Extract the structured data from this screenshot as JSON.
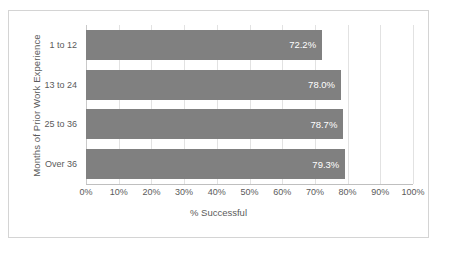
{
  "chart_data": {
    "type": "bar",
    "orientation": "horizontal",
    "title": "",
    "xlabel": "% Successful",
    "ylabel": "Months of Prior Work Experience",
    "categories": [
      "1 to 12",
      "13 to 24",
      "25 to 36",
      "Over 36"
    ],
    "values": [
      72.2,
      78.0,
      78.7,
      79.3
    ],
    "data_labels": [
      "72.2%",
      "78.0%",
      "78.7%",
      "79.3%"
    ],
    "xlim": [
      0,
      100
    ],
    "xticks": [
      0,
      10,
      20,
      30,
      40,
      50,
      60,
      70,
      80,
      90,
      100
    ],
    "xtick_labels": [
      "0%",
      "10%",
      "20%",
      "30%",
      "40%",
      "50%",
      "60%",
      "70%",
      "80%",
      "90%",
      "100%"
    ],
    "grid": "vertical",
    "legend": "none",
    "series": [
      {
        "name": "% Successful",
        "values": [
          72.2,
          78.0,
          78.7,
          79.3
        ],
        "color": "#808080"
      }
    ],
    "colors": {
      "bar": "#808080",
      "data_label_text": "#ffffff",
      "axis_text": "#5a5a5a",
      "gridline": "#e2e2e2",
      "frame_border": "#d4d4d4",
      "plot_background": "#ffffff"
    }
  }
}
